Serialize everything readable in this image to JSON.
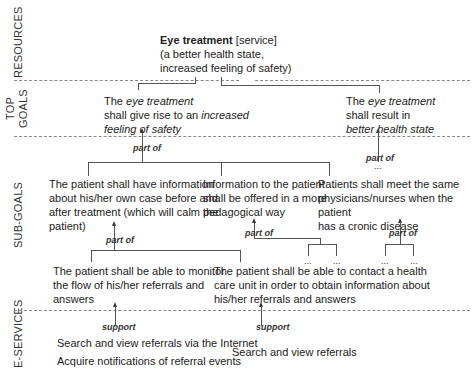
{
  "lanes": {
    "resources": "RESOURCES",
    "top_goals_1": "TOP",
    "top_goals_2": "GOALS",
    "sub_goals": "SUB-GOALS",
    "e_services": "E-SERVICES"
  },
  "resource": {
    "title": "Eye treatment",
    "tag": "[service]",
    "line2": "(a better health state,",
    "line3": "increased feeling of safety)"
  },
  "top_goals": [
    {
      "pre": "The ",
      "em": "eye treatment",
      "line2_pre": "shall give rise to an ",
      "line2_em": "increased",
      "line3_em": "feeling of safety"
    },
    {
      "pre": "The ",
      "em": "eye treatment",
      "line2": "shall result in",
      "line3_em": "better health state"
    }
  ],
  "sub_goals": [
    {
      "lines": [
        "The patient shall have information",
        "about his/her own case before and",
        "after treatment (which will calm the",
        "patient)"
      ]
    },
    {
      "lines": [
        "Information to the patient",
        "shall be offered in a more",
        "pedagogical way"
      ]
    },
    {
      "lines": [
        "Patients shall meet the same",
        "physicians/nurses when the patient",
        "has a cronic disease"
      ]
    }
  ],
  "leaf_goals": [
    {
      "lines": [
        "The patient shall be able to monitor",
        "the flow of his/her referrals and",
        "answers"
      ]
    },
    {
      "lines": [
        "The patient shall be able to contact a health",
        "care unit in order to obtain information about",
        "his/her referrals and answers"
      ]
    }
  ],
  "e_services": {
    "left": [
      "Search and view referrals via the Internet",
      "Acquire notifications of referral events"
    ],
    "right": [
      "Search and view referrals"
    ]
  },
  "relations": {
    "part_of": "part of",
    "support": "support",
    "ellipsis": "..."
  }
}
